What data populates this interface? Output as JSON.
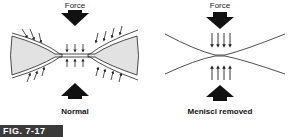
{
  "figure": {
    "label": "FIG. 7-17",
    "panels": [
      {
        "force_label": "Force",
        "caption": "Normal"
      },
      {
        "force_label": "Force",
        "caption": "Menisci removed"
      }
    ],
    "colors": {
      "fill": "#e2e2e2",
      "stroke": "#222222",
      "fig_bg": "#3a3a3a"
    }
  }
}
